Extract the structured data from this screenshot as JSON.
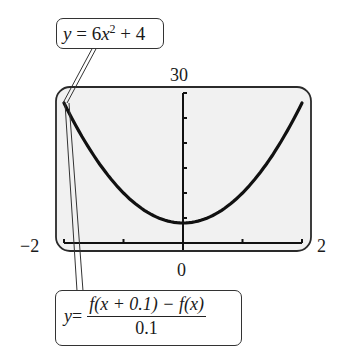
{
  "chart_data": {
    "type": "line",
    "title": "",
    "xlabel": "",
    "ylabel": "",
    "xlim": [
      -2,
      2
    ],
    "ylim": [
      0,
      30
    ],
    "x_tick_labels": {
      "min": "-2",
      "max": "2",
      "origin": "0"
    },
    "y_tick_labels": {
      "max": "30"
    },
    "x_ticks": [
      -2,
      -1,
      0,
      1,
      2
    ],
    "y_ticks": [
      0,
      5,
      10,
      15,
      20,
      25,
      30
    ],
    "grid": false,
    "series": [
      {
        "name": "y = 6x^2 + 4",
        "x": [
          -2,
          -1.5,
          -1,
          -0.5,
          0,
          0.5,
          1,
          1.5,
          2
        ],
        "values": [
          28,
          17.5,
          10,
          5.5,
          4,
          5.5,
          10,
          17.5,
          28
        ]
      },
      {
        "name": "y = (f(x + 0.1) - f(x)) / 0.1",
        "x": [
          -2
        ],
        "values": [
          27.9
        ],
        "note": "drawn only at left edge where it overlaps"
      }
    ],
    "annotations": [
      {
        "text": "y = 6x^2 + 4",
        "points_to": [
          -2,
          28
        ]
      },
      {
        "text": "y = (f(x + 0.1) - f(x)) / 0.1",
        "points_to": [
          -2,
          28
        ]
      }
    ]
  },
  "labels": {
    "y_max": "30",
    "x_min": "−2",
    "x_max": "2",
    "x_origin": "0"
  },
  "callouts": {
    "top": {
      "y": "y",
      "equals": " = 6",
      "x": "x",
      "exp": "2",
      "rest": " + 4"
    },
    "bottom": {
      "y": "y",
      "equals": " =",
      "numerator": "f(x + 0.1) − f(x)",
      "denominator": "0.1"
    }
  },
  "colors": {
    "screen_bg": "#f1f1f1",
    "frame": "#2a2a2a",
    "curve": "#111111"
  }
}
